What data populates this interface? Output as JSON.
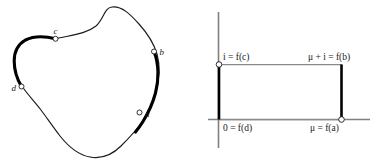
{
  "figure": {
    "title": "",
    "background_color": "#ffffff",
    "panels": [
      {
        "id": "curve-panel",
        "name": "closed-curve-diagram",
        "description": "closed irregular loop with four marked boundary points",
        "curve_color": "#1a1a1a",
        "highlight_color": "#000000",
        "points": [
          {
            "id": "a",
            "label": "a",
            "label_side": "right"
          },
          {
            "id": "b",
            "label": "b",
            "label_side": "right"
          },
          {
            "id": "c",
            "label": "c",
            "label_side": "above"
          },
          {
            "id": "d",
            "label": "d",
            "label_side": "left"
          }
        ],
        "highlighted_arcs": [
          {
            "from": "b",
            "to": "a"
          },
          {
            "from": "d",
            "to": "c"
          }
        ]
      },
      {
        "id": "rectangle-panel",
        "name": "complex-plane-rectangle-diagram",
        "description": "rectangle in the complex plane with labelled corners on coordinate axes",
        "axis_color": "#808080",
        "rect_side_color": "#000000",
        "rect_edge_color": "#8a8a8a",
        "corner_labels": {
          "top_left": "i = f(c)",
          "top_right": "μ + i = f(b)",
          "bottom_left": "0 = f(d)",
          "bottom_right": "μ = f(a)"
        },
        "corner_label_parts": {
          "top_left": {
            "lhs": "i",
            "rel": "=",
            "fn": "f",
            "arg": "(c)"
          },
          "top_right": {
            "lhs": "μ + i",
            "rel": "=",
            "fn": "f",
            "arg": "(b)"
          },
          "bottom_left": {
            "lhs": "0",
            "rel": "=",
            "fn": "f",
            "arg": "(d)"
          },
          "bottom_right": {
            "lhs": "μ",
            "rel": "=",
            "fn": "f",
            "arg": "(a)"
          }
        },
        "markers": [
          {
            "id": "top-left-corner",
            "at": "i = f(c)"
          },
          {
            "id": "bottom-right-corner",
            "at": "μ = f(a)"
          }
        ]
      }
    ]
  }
}
